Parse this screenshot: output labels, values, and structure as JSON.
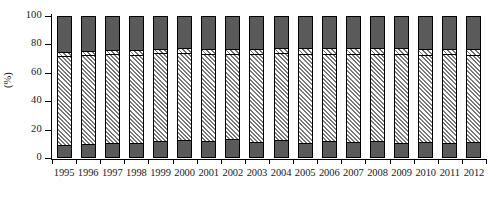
{
  "chart_data": {
    "type": "bar",
    "stacked": true,
    "normalized_percent": true,
    "title": "",
    "subtitle": "",
    "xlabel": "",
    "ylabel": "(%)",
    "ylim": [
      0,
      100
    ],
    "yticks": [
      0,
      20,
      40,
      60,
      80,
      100
    ],
    "ytick_labels": [
      "0",
      "20",
      "40",
      "60",
      "80",
      "100"
    ],
    "grid": false,
    "legend": null,
    "legend_position": "none",
    "annotations": [],
    "categories": [
      "1995",
      "1996",
      "1997",
      "1998",
      "1999",
      "2000",
      "2001",
      "2002",
      "2003",
      "2004",
      "2005",
      "2006",
      "2007",
      "2008",
      "2009",
      "2010",
      "2011",
      "2012"
    ],
    "series": [
      {
        "name": "segment-bottom-dark",
        "fill": "dark-gray-solid",
        "color": "#5a5a5a",
        "values": [
          9.5,
          10.0,
          10.8,
          10.7,
          12.2,
          12.8,
          12.2,
          13.2,
          11.5,
          12.7,
          10.5,
          12.0,
          11.6,
          11.8,
          10.6,
          11.5,
          10.3,
          11.2
        ]
      },
      {
        "name": "segment-middle-hatch",
        "fill": "diagonal-hatch-light",
        "color": "#ededed",
        "values": [
          62.5,
          62.5,
          62.4,
          62.0,
          61.7,
          61.3,
          61.0,
          60.2,
          62.0,
          61.0,
          62.9,
          61.3,
          61.7,
          61.4,
          62.5,
          61.3,
          62.6,
          61.6
        ]
      },
      {
        "name": "segment-upper-hatch",
        "fill": "diagonal-hatch-white",
        "color": "#ffffff",
        "values": [
          2.4,
          2.6,
          2.8,
          3.2,
          3.0,
          3.3,
          3.6,
          3.4,
          3.5,
          3.6,
          3.8,
          3.9,
          3.9,
          4.0,
          4.1,
          4.0,
          4.2,
          4.3
        ]
      },
      {
        "name": "segment-top-dark",
        "fill": "dark-gray-solid",
        "color": "#5a5a5a",
        "values": [
          25.6,
          24.9,
          24.0,
          24.1,
          23.1,
          22.6,
          23.2,
          23.2,
          23.0,
          22.7,
          22.8,
          22.8,
          22.8,
          22.8,
          22.8,
          23.2,
          22.9,
          22.9
        ]
      }
    ]
  },
  "axis": {
    "y_title": "(%)",
    "y_tick_labels": [
      "100",
      "80",
      "60",
      "40",
      "20",
      "0"
    ],
    "x_tick_labels": [
      "1995",
      "1996",
      "1997",
      "1998",
      "1999",
      "2000",
      "2001",
      "2002",
      "2003",
      "2004",
      "2005",
      "2006",
      "2007",
      "2008",
      "2009",
      "2010",
      "2011",
      "2012"
    ]
  },
  "style": {
    "bar_dark": "#5a5a5a",
    "bar_hatch_light": "#ededed",
    "bar_hatch_white": "#ffffff",
    "outline": "#000000",
    "background": "#ffffff"
  }
}
